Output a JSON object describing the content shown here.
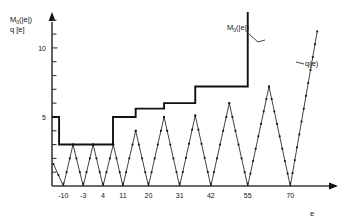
{
  "figure": {
    "yaxis_label_line1": "M",
    "yaxis_label_line1_sub": "0",
    "yaxis_label_line1_tail": "(|e|)",
    "yaxis_label_line2": "q [e]",
    "xaxis_label": "e"
  },
  "curve_labels": {
    "stair": "M",
    "stair_sub": "0",
    "stair_tail": "(|e|)",
    "saw": "q(e)"
  },
  "chart_data": {
    "type": "line",
    "title": "",
    "xlabel": "e",
    "ylabel": "M0(|e|)  q [e]",
    "xlim": [
      -14,
      84
    ],
    "ylim": [
      0,
      12.6
    ],
    "grid": false,
    "legend_position": "inline-annotations",
    "y_ticks_major": [
      5,
      10
    ],
    "y_ticks_major_labels": [
      "5",
      "10"
    ],
    "y_ticks_minor": [
      1,
      2,
      3,
      4,
      6,
      7,
      8,
      9,
      11,
      12
    ],
    "x_ticks": [
      -10,
      -3,
      4,
      11,
      20,
      31,
      42,
      55,
      70
    ],
    "x_tick_labels": [
      "-10",
      "-3",
      "4",
      "11",
      "20",
      "31",
      "42",
      "55",
      "70"
    ],
    "series": [
      {
        "name": "M0(|e|)",
        "type": "step",
        "style": "thick-staircase",
        "points": [
          {
            "x": -14,
            "y": 5
          },
          {
            "x": -11.5,
            "y": 5
          },
          {
            "x": -11.5,
            "y": 3
          },
          {
            "x": 7.5,
            "y": 3
          },
          {
            "x": 7.5,
            "y": 5
          },
          {
            "x": 15.5,
            "y": 5
          },
          {
            "x": 15.5,
            "y": 5.6
          },
          {
            "x": 25.5,
            "y": 5.6
          },
          {
            "x": 25.5,
            "y": 6
          },
          {
            "x": 36.5,
            "y": 6
          },
          {
            "x": 36.5,
            "y": 7.2
          },
          {
            "x": 55.0,
            "y": 7.2
          },
          {
            "x": 55.0,
            "y": 12.6
          }
        ]
      },
      {
        "name": "q(e)",
        "type": "triangular-wave",
        "style": "thin-with-markers",
        "marker": "square-dot",
        "vertices": [
          {
            "x": -13.5,
            "y": 1.6
          },
          {
            "x": -10.0,
            "y": 0.0
          },
          {
            "x": -6.6,
            "y": 3.0
          },
          {
            "x": -3.0,
            "y": 0.0
          },
          {
            "x": 0.5,
            "y": 3.0
          },
          {
            "x": 4.0,
            "y": 0.0
          },
          {
            "x": 7.6,
            "y": 3.0
          },
          {
            "x": 11.0,
            "y": 0.0
          },
          {
            "x": 15.5,
            "y": 4.0
          },
          {
            "x": 20.0,
            "y": 0.0
          },
          {
            "x": 25.5,
            "y": 5.0
          },
          {
            "x": 31.0,
            "y": 0.0
          },
          {
            "x": 36.5,
            "y": 5.1
          },
          {
            "x": 42.0,
            "y": 0.0
          },
          {
            "x": 48.5,
            "y": 6.0
          },
          {
            "x": 55.0,
            "y": 0.0
          },
          {
            "x": 62.5,
            "y": 7.2
          },
          {
            "x": 70.0,
            "y": 0.0
          },
          {
            "x": 79.5,
            "y": 11.2
          }
        ]
      }
    ]
  }
}
